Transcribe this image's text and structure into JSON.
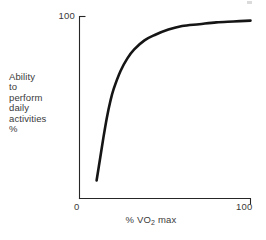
{
  "chart_data": {
    "type": "line",
    "title": "",
    "subtitle": "",
    "xlabel": "% VO2 max",
    "xlabel_prefix": "% VO",
    "xlabel_sub": "2",
    "xlabel_suffix": " max",
    "ylabel_lines": [
      "Ability",
      "to",
      "perform",
      "daily",
      "activities",
      "%"
    ],
    "ylabel": "Ability to perform daily activities %",
    "xlim": [
      0,
      100
    ],
    "ylim": [
      0,
      100
    ],
    "xticks": [
      "0",
      "100"
    ],
    "yticks": [
      "100"
    ],
    "xtick_zero": "0",
    "xtick_max": "100",
    "ytick_max": "100",
    "grid": false,
    "legend": false,
    "legend_position": "none",
    "curve_color": "#151515",
    "axis_color": "#262626",
    "background_color": "#ffffff",
    "series": [
      {
        "name": "Ability to perform daily activities",
        "x": [
          10,
          12,
          14,
          16,
          18,
          20,
          24,
          28,
          32,
          38,
          44,
          52,
          60,
          70,
          80,
          90,
          100
        ],
        "y": [
          10,
          22,
          34,
          45,
          54,
          61,
          71,
          78,
          83,
          88,
          91,
          94,
          96,
          97,
          98,
          98.5,
          99
        ]
      }
    ]
  }
}
